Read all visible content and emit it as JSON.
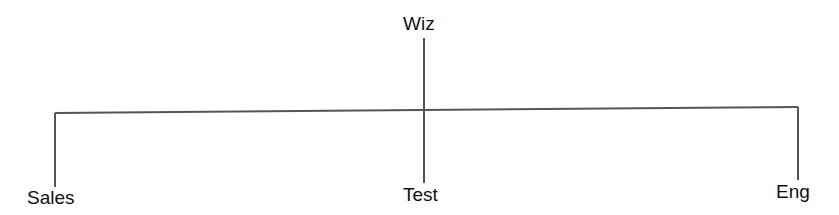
{
  "diagram": {
    "type": "org-tree",
    "root": {
      "label": "Wiz"
    },
    "children": [
      {
        "label": "Sales"
      },
      {
        "label": "Test"
      },
      {
        "label": "Eng"
      }
    ],
    "colors": {
      "line": "#555555",
      "text": "#111111",
      "background": "#ffffff"
    }
  }
}
